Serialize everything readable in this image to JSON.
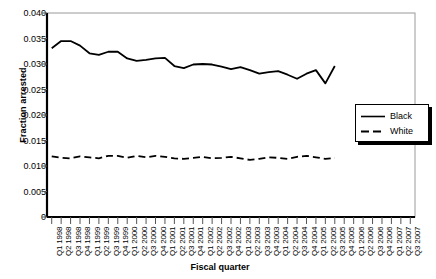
{
  "chart_data": {
    "type": "line",
    "title": "",
    "xlabel": "Fiscal quarter",
    "ylabel": "Fraction arrested",
    "ylim": [
      0,
      0.04
    ],
    "ytick_labels": [
      "0",
      "0.005",
      "0.010",
      "0.015",
      "0.020",
      "0.025",
      "0.030",
      "0.035",
      "0.040"
    ],
    "ytick_values": [
      0,
      0.005,
      0.01,
      0.015,
      0.02,
      0.025,
      0.03,
      0.035,
      0.04
    ],
    "grid": false,
    "legend_position": "right-middle",
    "categories": [
      "Q1 1998",
      "Q2 1998",
      "Q3 1998",
      "Q4 1998",
      "Q1 1999",
      "Q2 1999",
      "Q3 1999",
      "Q4 1999",
      "Q1 2000",
      "Q2 2000",
      "Q3 2000",
      "Q4 2000",
      "Q1 2001",
      "Q2 2001",
      "Q3 2001",
      "Q4 2001",
      "Q1 2002",
      "Q2 2002",
      "Q3 2002",
      "Q4 2002",
      "Q1 2003",
      "Q2 2003",
      "Q3 2003",
      "Q4 2003",
      "Q1 2004",
      "Q2 2004",
      "Q3 2004",
      "Q4 2004",
      "Q1 2005",
      "Q2 2005",
      "Q3 2005",
      "Q4 2005",
      "Q1 2006",
      "Q2 2006",
      "Q3 2006",
      "Q4 2006",
      "Q1 2007",
      "Q2 2007",
      "Q3 2007"
    ],
    "series": [
      {
        "name": "Black",
        "style": "solid",
        "color": "#000000",
        "values": [
          0.0331,
          0.0345,
          0.0345,
          0.0336,
          0.0321,
          0.0318,
          0.0324,
          0.0324,
          0.0311,
          0.0306,
          0.0308,
          0.0311,
          0.0312,
          0.0296,
          0.0292,
          0.0299,
          0.03,
          0.0299,
          0.0295,
          0.029,
          0.0294,
          0.0288,
          0.0281,
          0.0284,
          0.0286,
          0.0279,
          0.0271,
          0.0281,
          0.0288,
          0.0262,
          0.0296,
          null,
          null,
          null,
          null,
          null,
          null,
          null,
          null
        ]
      },
      {
        "name": "White",
        "style": "dashed",
        "color": "#000000",
        "values": [
          0.0119,
          0.0116,
          0.0115,
          0.0119,
          0.0117,
          0.0115,
          0.012,
          0.012,
          0.0116,
          0.012,
          0.0117,
          0.012,
          0.0118,
          0.0115,
          0.0114,
          0.0116,
          0.0118,
          0.0115,
          0.0116,
          0.0118,
          0.0115,
          0.0112,
          0.0114,
          0.0117,
          0.0116,
          0.0114,
          0.0118,
          0.012,
          0.0117,
          0.0114,
          0.0116,
          null,
          null,
          null,
          null,
          null,
          null,
          null,
          null
        ]
      }
    ]
  },
  "legend": {
    "items": [
      {
        "label": "Black"
      },
      {
        "label": "White"
      }
    ]
  }
}
